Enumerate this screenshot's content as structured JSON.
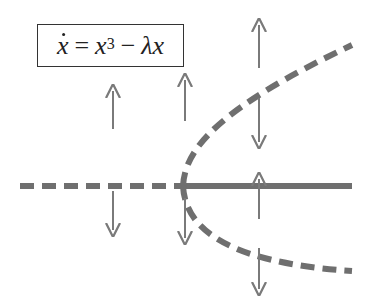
{
  "equation": {
    "lhs": "x",
    "equals": "=",
    "term1": "x",
    "exponent": "3",
    "minus": "−",
    "term2": "λx",
    "full_text": "ẋ = x³ − λx"
  },
  "colors": {
    "curve": "#6f6f6f",
    "arrow": "#7a7a7a",
    "box_border": "#333333",
    "text": "#222222"
  },
  "diagram": {
    "type": "pitchfork-bifurcation",
    "branches": [
      {
        "name": "x=0 for λ<0",
        "style": "dashed",
        "stability": "unstable"
      },
      {
        "name": "x=0 for λ>0",
        "style": "solid",
        "stability": "stable"
      },
      {
        "name": "x=+sqrt(λ)",
        "style": "dashed",
        "stability": "unstable"
      },
      {
        "name": "x=-sqrt(λ)",
        "style": "dashed",
        "stability": "unstable"
      }
    ],
    "flow_arrows": [
      {
        "x": 113,
        "direction": "up",
        "region": "above"
      },
      {
        "x": 113,
        "direction": "down",
        "region": "below"
      },
      {
        "x": 185,
        "direction": "up",
        "region": "above"
      },
      {
        "x": 185,
        "direction": "down",
        "region": "below"
      },
      {
        "x": 259,
        "direction": "up",
        "region": "top"
      },
      {
        "x": 259,
        "direction": "down",
        "region": "between-upper"
      },
      {
        "x": 259,
        "direction": "up",
        "region": "between-lower"
      },
      {
        "x": 259,
        "direction": "down",
        "region": "bottom"
      }
    ]
  }
}
